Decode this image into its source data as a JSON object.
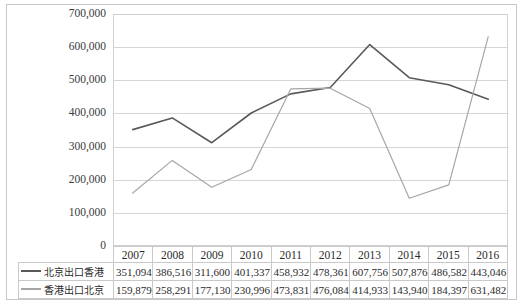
{
  "chart_data": {
    "type": "line",
    "title": "",
    "xlabel": "",
    "ylabel": "",
    "ylim": [
      0,
      700000
    ],
    "ytick_step": 100000,
    "grid": true,
    "legend_position": "table-left",
    "categories": [
      "2007",
      "2008",
      "2009",
      "2010",
      "2011",
      "2012",
      "2013",
      "2014",
      "2015",
      "2016"
    ],
    "ytick_labels": [
      "700,000",
      "600,000",
      "500,000",
      "400,000",
      "300,000",
      "200,000",
      "100,000",
      "0"
    ],
    "ytick_values": [
      700000,
      600000,
      500000,
      400000,
      300000,
      200000,
      100000,
      0
    ],
    "series": [
      {
        "name": "北京出口香港",
        "color": "#595959",
        "values": [
          351094,
          386516,
          311600,
          401337,
          458932,
          478361,
          607756,
          507876,
          486582,
          443046
        ],
        "labels": [
          "351,094",
          "386,516",
          "311,600",
          "401,337",
          "458,932",
          "478,361",
          "607,756",
          "507,876",
          "486,582",
          "443,046"
        ]
      },
      {
        "name": "香港出口北京",
        "color": "#a6a6a6",
        "values": [
          159879,
          258291,
          177130,
          230996,
          473831,
          476084,
          414933,
          143940,
          184397,
          631482
        ],
        "labels": [
          "159,879",
          "258,291",
          "177,130",
          "230,996",
          "473,831",
          "476,084",
          "414,933",
          "143,940",
          "184,397",
          "631,482"
        ]
      }
    ]
  }
}
